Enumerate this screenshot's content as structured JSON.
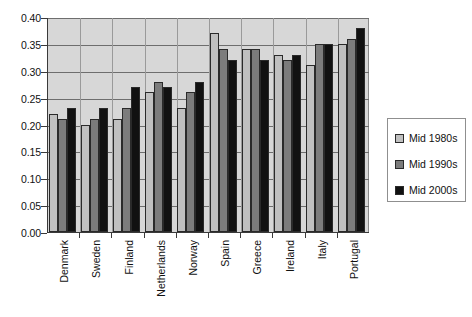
{
  "chart_data": {
    "type": "bar",
    "title": "",
    "subtitle": "",
    "xlabel": "",
    "ylabel": "",
    "ylim": [
      0.0,
      0.4
    ],
    "yticks": [
      "0.00",
      "0.05",
      "0.10",
      "0.15",
      "0.20",
      "0.25",
      "0.30",
      "0.35",
      "0.40"
    ],
    "ytick_values": [
      0.0,
      0.05,
      0.1,
      0.15,
      0.2,
      0.25,
      0.3,
      0.35,
      0.4
    ],
    "grid": "horizontal",
    "legend_position": "right",
    "categories": [
      "Denmark",
      "Sweden",
      "Finland",
      "Netherlands",
      "Norway",
      "Spain",
      "Greece",
      "Ireland",
      "Italy",
      "Portugal"
    ],
    "series": [
      {
        "name": "Mid 1980s",
        "color": "#c0c0c0",
        "values": [
          0.22,
          0.2,
          0.21,
          0.26,
          0.23,
          0.37,
          0.34,
          0.33,
          0.31,
          0.35
        ]
      },
      {
        "name": "Mid 1990s",
        "color": "#7c7c7c",
        "values": [
          0.21,
          0.21,
          0.23,
          0.28,
          0.26,
          0.34,
          0.34,
          0.32,
          0.35,
          0.36
        ]
      },
      {
        "name": "Mid 2000s",
        "color": "#111111",
        "values": [
          0.23,
          0.23,
          0.27,
          0.27,
          0.28,
          0.32,
          0.32,
          0.33,
          0.35,
          0.38
        ]
      }
    ],
    "plot_background": "#d7d7d7",
    "legend_background": "#ffffff"
  }
}
